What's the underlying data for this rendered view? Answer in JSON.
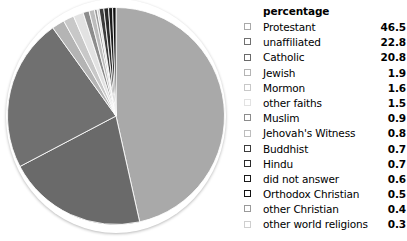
{
  "legend": {
    "header": "percentage",
    "rows": [
      {
        "label": "Protestant",
        "value": "46.5",
        "swatch": "#a9a9a9"
      },
      {
        "label": "unaffiliated",
        "value": "22.8",
        "swatch": "#707070"
      },
      {
        "label": "Catholic",
        "value": "20.8",
        "swatch": "#6a6a6a"
      },
      {
        "label": "Jewish",
        "value": "1.9",
        "swatch": "#b4b4b4"
      },
      {
        "label": "Mormon",
        "value": "1.6",
        "swatch": "#c8c8c8"
      },
      {
        "label": "other faiths",
        "value": "1.5",
        "swatch": "#e2e2e2"
      },
      {
        "label": "Muslim",
        "value": "0.9",
        "swatch": "#8c8c8c"
      },
      {
        "label": "Jehovah's Witness",
        "value": "0.8",
        "swatch": "#bdbdbd"
      },
      {
        "label": "Buddhist",
        "value": "0.7",
        "swatch": "#3c3c3c"
      },
      {
        "label": "Hindu",
        "value": "0.7",
        "swatch": "#2a2a2a"
      },
      {
        "label": "did not answer",
        "value": "0.6",
        "swatch": "#1a1a1a"
      },
      {
        "label": "Orthodox Christian",
        "value": "0.5",
        "swatch": "#111111"
      },
      {
        "label": "other Christian",
        "value": "0.4",
        "swatch": "#9a9a9a"
      },
      {
        "label": "other world religions",
        "value": "0.3",
        "swatch": "#cfcfcf"
      }
    ]
  },
  "chart_data": {
    "type": "pie",
    "title": "",
    "unit": "percent",
    "start_angle_deg": 0,
    "direction": "clockwise",
    "legend_position": "right",
    "legend_title": "percentage",
    "categories": [
      "Protestant",
      "unaffiliated",
      "Catholic",
      "Jewish",
      "Mormon",
      "other faiths",
      "Muslim",
      "Jehovah's Witness",
      "Buddhist",
      "Hindu",
      "did not answer",
      "Orthodox Christian",
      "other Christian",
      "other world religions"
    ],
    "values": [
      46.5,
      22.8,
      20.8,
      1.9,
      1.6,
      1.5,
      0.9,
      0.8,
      0.7,
      0.7,
      0.6,
      0.5,
      0.4,
      0.3
    ],
    "colors": [
      "#a9a9a9",
      "#707070",
      "#6a6a6a",
      "#b4b4b4",
      "#c8c8c8",
      "#e2e2e2",
      "#8c8c8c",
      "#bdbdbd",
      "#3c3c3c",
      "#2a2a2a",
      "#1a1a1a",
      "#111111",
      "#9a9a9a",
      "#cfcfcf"
    ],
    "slice_order_clockwise_from_12": [
      "Protestant",
      "Catholic",
      "unaffiliated",
      "Jewish",
      "Mormon",
      "other faiths",
      "Muslim",
      "Jehovah's Witness",
      "other Christian",
      "other world religions",
      "Buddhist",
      "Hindu",
      "did not answer",
      "Orthodox Christian"
    ]
  }
}
